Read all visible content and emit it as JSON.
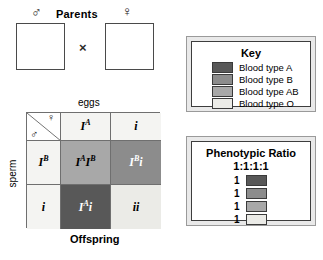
{
  "parents": {
    "title": "Parents",
    "male_symbol": "♂",
    "female_symbol": "♀",
    "cross_symbol": "×",
    "male": {
      "allele1": "I",
      "sup1": "B",
      "allele2": "i",
      "color": "#8c8c8c",
      "label": "IᴮI"
    },
    "female": {
      "allele1": "I",
      "sup1": "A",
      "allele2": "i",
      "color": "#585858"
    }
  },
  "punnett": {
    "top_label": "eggs",
    "side_label": "sperm",
    "bottom_label": "Offspring",
    "corner_female": "♀",
    "corner_male": "♂",
    "col_headers": [
      {
        "allele": "I",
        "sup": "A"
      },
      {
        "allele": "i",
        "sup": ""
      }
    ],
    "row_headers": [
      {
        "allele": "I",
        "sup": "B"
      },
      {
        "allele": "i",
        "sup": ""
      }
    ],
    "cells": [
      {
        "g1": "I",
        "s1": "A",
        "g2": "I",
        "s2": "B",
        "blood_type": "AB",
        "color": "#a8a8a8",
        "text_color": "dark"
      },
      {
        "g1": "I",
        "s1": "B",
        "g2": "i",
        "s2": "",
        "blood_type": "B",
        "color": "#8c8c8c",
        "text_color": "light"
      },
      {
        "g1": "I",
        "s1": "A",
        "g2": "i",
        "s2": "",
        "blood_type": "A",
        "color": "#585858",
        "text_color": "light"
      },
      {
        "g1": "i",
        "s1": "",
        "g2": "i",
        "s2": "",
        "blood_type": "O",
        "color": "#ebebe7",
        "text_color": "dark"
      }
    ]
  },
  "key": {
    "title": "Key",
    "entries": [
      {
        "label": "Blood type A",
        "color": "#585858"
      },
      {
        "label": "Blood type B",
        "color": "#8c8c8c"
      },
      {
        "label": "Blood type AB",
        "color": "#a8a8a8"
      },
      {
        "label": "Blood type O",
        "color": "#ebebe7"
      }
    ]
  },
  "ratio": {
    "title": "Phenotypic Ratio",
    "value": "1:1:1:1",
    "entries": [
      {
        "count": "1",
        "color": "#585858"
      },
      {
        "count": "1",
        "color": "#8c8c8c"
      },
      {
        "count": "1",
        "color": "#a8a8a8"
      },
      {
        "count": "1",
        "color": "#ebebe7"
      }
    ]
  }
}
